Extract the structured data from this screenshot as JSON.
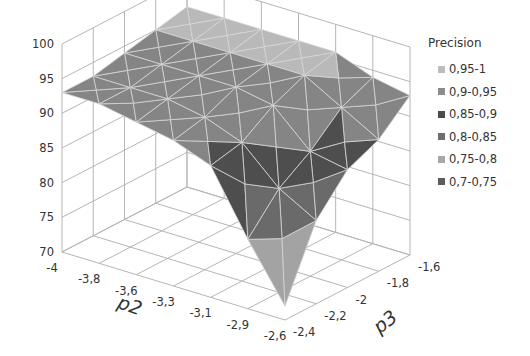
{
  "chart_data": {
    "type": "surface3d",
    "title": "",
    "xlabel": "p2",
    "ylabel": "p3",
    "zlabel": "",
    "x_ticks": [
      "-4",
      "-3,8",
      "-3,6",
      "-3,3",
      "-3,1",
      "-2,9",
      "-2,6"
    ],
    "y_ticks": [
      "-2,4",
      "-2,2",
      "-2",
      "-1,8",
      "-1,6"
    ],
    "z_ticks": [
      "70",
      "75",
      "80",
      "85",
      "90",
      "95",
      "100"
    ],
    "zlim": [
      70,
      100
    ],
    "z_grid": [
      [
        93,
        93,
        94,
        95,
        96
      ],
      [
        93,
        93,
        94,
        95,
        96
      ],
      [
        92,
        93,
        94,
        95,
        96
      ],
      [
        91,
        92,
        94,
        95,
        96
      ],
      [
        89,
        90,
        93,
        95,
        96
      ],
      [
        80,
        85,
        88,
        92,
        94
      ],
      [
        72,
        82,
        87,
        89,
        93
      ]
    ],
    "legend": {
      "title": "Precision",
      "position": "right",
      "entries": [
        {
          "label": "0,95-1",
          "color": "#bdbdbd"
        },
        {
          "label": "0,9-0,95",
          "color": "#8c8c8c"
        },
        {
          "label": "0,85-0,9",
          "color": "#4a4a4a"
        },
        {
          "label": "0,8-0,85",
          "color": "#6e6e6e"
        },
        {
          "label": "0,75-0,8",
          "color": "#a8a8a8"
        },
        {
          "label": "0,7-0,75",
          "color": "#5c5c5c"
        }
      ]
    },
    "grid": true
  }
}
